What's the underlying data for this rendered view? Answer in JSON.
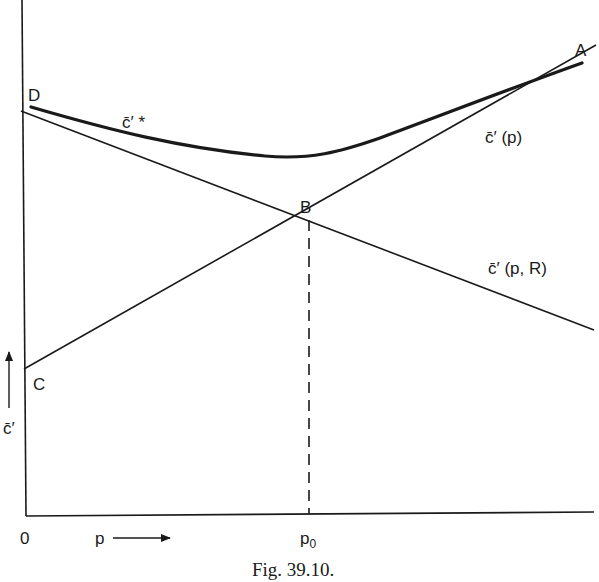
{
  "figure": {
    "caption": "Fig. 39.10.",
    "axes": {
      "origin_label": "0",
      "x_label": "p",
      "y_label": "c̄′",
      "x_tick_label_base": "p",
      "x_tick_label_sub": "0"
    },
    "points": {
      "A": "A",
      "B": "B",
      "C": "C",
      "D": "D"
    },
    "curves": {
      "envelope": {
        "label": "c̄′ *",
        "points": "D → A",
        "style": "thick"
      },
      "rising_line": {
        "label": "c̄′ (p)",
        "points": "C → B → A",
        "style": "thin"
      },
      "falling_line": {
        "label": "c̄′ (p, R)",
        "points": "D → B",
        "style": "thin"
      },
      "guide": {
        "label": "",
        "points": "B → p0",
        "style": "dashed"
      }
    },
    "colors": {
      "ink": "#1a1a1a",
      "background": "#ffffff"
    }
  }
}
